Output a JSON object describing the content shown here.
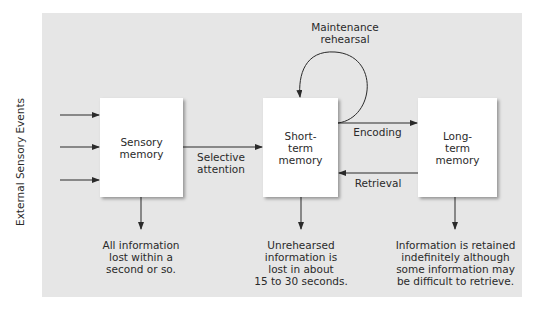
{
  "diagram": {
    "side_label": "External Sensory Events",
    "boxes": {
      "sensory": "Sensory\nmemory",
      "short_term": "Short-\nterm\nmemory",
      "long_term": "Long-\nterm\nmemory"
    },
    "arrows": {
      "selective_attention": "Selective\nattention",
      "maintenance_rehearsal": "Maintenance\nrehearsal",
      "encoding": "Encoding",
      "retrieval": "Retrieval"
    },
    "outcomes": {
      "sensory": "All information\nlost within a\nsecond or so.",
      "short_term": "Unrehearsed\ninformation is\nlost in about\n15 to 30 seconds.",
      "long_term": "Information is retained\nindefinitely although\nsome information may\nbe difficult to retrieve."
    },
    "colors": {
      "panel": "#e6e6e6",
      "box": "#ffffff",
      "line": "#2a2a2a",
      "text": "#2a2a2a"
    }
  }
}
